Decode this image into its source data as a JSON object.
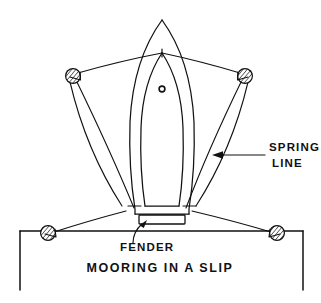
{
  "figure": {
    "title": "MOORING IN A SLIP",
    "kind": "line-drawing-diagram",
    "ink_color": "#111111",
    "background_color": "#ffffff"
  },
  "labels": {
    "spring_line_1": "SPRING",
    "spring_line_2": "LINE",
    "fender": "FENDER",
    "caption": "MOORING IN A SLIP"
  },
  "parts": {
    "boat_name": "boat-hull-plan-view",
    "mast_name": "mast-marker",
    "fender_name": "fender-block",
    "dock_name": "dock-slip-outline",
    "bow_cleat_name": "bow-cleat",
    "stern_cleat_left_name": "stern-cleat-left",
    "stern_cleat_right_name": "stern-cleat-right"
  },
  "pilings": [
    {
      "id": "piling-upper-left",
      "cx": 73,
      "cy": 76,
      "r": 7.5,
      "style": "hatched"
    },
    {
      "id": "piling-upper-right",
      "cx": 245,
      "cy": 76,
      "r": 7.5,
      "style": "hatched"
    },
    {
      "id": "piling-lower-left",
      "cx": 48,
      "cy": 233,
      "r": 7.5,
      "style": "hatched"
    },
    {
      "id": "piling-lower-right",
      "cx": 277,
      "cy": 233,
      "r": 7.5,
      "style": "hatched"
    }
  ],
  "lines": {
    "bow_lines": [
      {
        "id": "bow-line-port",
        "from": "piling-upper-left",
        "to": "bow-cleat"
      },
      {
        "id": "bow-line-starboard",
        "from": "piling-upper-right",
        "to": "bow-cleat"
      }
    ],
    "spring_lines": [
      {
        "id": "spring-line-port",
        "from": "piling-upper-left",
        "to": "stern-cleat-left"
      },
      {
        "id": "spring-line-starboard",
        "from": "piling-upper-right",
        "to": "stern-cleat-right"
      }
    ],
    "stern_lines": [
      {
        "id": "stern-line-port",
        "from": "stern-cleat-left",
        "to": "piling-lower-left"
      },
      {
        "id": "stern-line-starboard",
        "from": "stern-cleat-right",
        "to": "piling-lower-right"
      }
    ]
  },
  "callouts": [
    {
      "id": "spring-line-callout",
      "text_lines": [
        "SPRING",
        "LINE"
      ],
      "points_to": "spring-line-starboard"
    },
    {
      "id": "fender-callout",
      "text_lines": [
        "FENDER"
      ],
      "points_to": "fender-block"
    }
  ]
}
